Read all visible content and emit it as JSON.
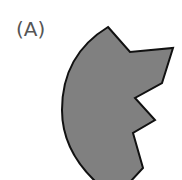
{
  "figure": {
    "label": "(A)",
    "shape": {
      "description": "sector-shaped figure with notched right edge",
      "fill": "#808080",
      "stroke": "#111111"
    }
  }
}
